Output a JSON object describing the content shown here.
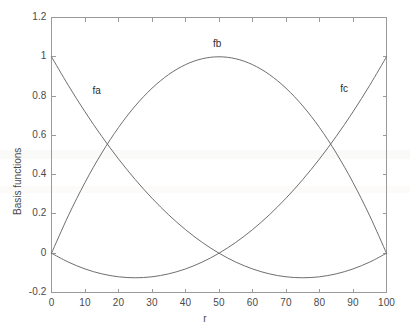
{
  "chart_data": {
    "type": "line",
    "title": "",
    "xlabel": "r",
    "ylabel": "Basis functions",
    "xlim": [
      0,
      100
    ],
    "ylim": [
      -0.2,
      1.2
    ],
    "xticks": [
      0,
      10,
      20,
      30,
      40,
      50,
      60,
      70,
      80,
      90,
      100
    ],
    "xtick_labels": [
      "0",
      "10",
      "20",
      "30",
      "40",
      "50",
      "60",
      "70",
      "80",
      "90",
      "100"
    ],
    "yticks": [
      -0.2,
      0,
      0.2,
      0.4,
      0.6,
      0.8,
      1,
      1.2
    ],
    "ytick_labels": [
      "-0.2",
      "0",
      "0.2",
      "0.4",
      "0.6",
      "0.8",
      "1",
      "1.2"
    ],
    "grid": false,
    "legend": "inline-annotations",
    "line_color": "#6e6e6e",
    "axis_color": "#9a9a9a",
    "background": "#ffffff",
    "x": [
      0,
      5,
      10,
      15,
      20,
      25,
      30,
      35,
      40,
      45,
      50,
      55,
      60,
      65,
      70,
      75,
      80,
      85,
      90,
      95,
      100
    ],
    "series": [
      {
        "name": "fa",
        "label": "fa",
        "annotation": {
          "text": "fa",
          "x": 14,
          "y": 0.82
        },
        "values": [
          1.0,
          0.855,
          0.72,
          0.595,
          0.48,
          0.375,
          0.28,
          0.195,
          0.12,
          0.055,
          0.0,
          -0.045,
          -0.08,
          -0.105,
          -0.12,
          -0.125,
          -0.12,
          -0.105,
          -0.08,
          -0.045,
          0.0
        ]
      },
      {
        "name": "fb",
        "label": "fb",
        "annotation": {
          "text": "fb",
          "x": 50,
          "y": 1.06
        },
        "values": [
          0.0,
          0.19,
          0.36,
          0.51,
          0.64,
          0.75,
          0.84,
          0.91,
          0.96,
          0.99,
          1.0,
          0.99,
          0.96,
          0.91,
          0.84,
          0.75,
          0.64,
          0.51,
          0.36,
          0.19,
          0.0
        ]
      },
      {
        "name": "fc",
        "label": "fc",
        "annotation": {
          "text": "fc",
          "x": 88,
          "y": 0.83
        },
        "values": [
          0.0,
          -0.045,
          -0.08,
          -0.105,
          -0.12,
          -0.125,
          -0.12,
          -0.105,
          -0.08,
          -0.045,
          0.0,
          0.055,
          0.12,
          0.195,
          0.28,
          0.375,
          0.48,
          0.595,
          0.72,
          0.855,
          1.0
        ]
      }
    ],
    "notes": {
      "intersections": [
        {
          "between": [
            "fa",
            "fb"
          ],
          "x": 18,
          "y": 0.55
        },
        {
          "between": [
            "fa",
            "fc"
          ],
          "x": 50,
          "y": 0.0
        },
        {
          "between": [
            "fb",
            "fc"
          ],
          "x": 82,
          "y": 0.55
        }
      ]
    }
  }
}
